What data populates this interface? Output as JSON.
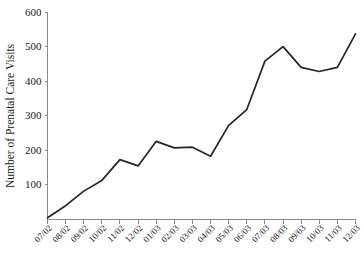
{
  "chart_data": {
    "type": "line",
    "title": "",
    "xlabel": "",
    "ylabel": "Number of Prenatal Care Visits",
    "categories": [
      "07/02",
      "08/02",
      "09/02",
      "10/02",
      "11/02",
      "12/02",
      "01/03",
      "02/03",
      "03/03",
      "04/03",
      "05/03",
      "06/03",
      "07/03",
      "08/03",
      "09/03",
      "10/03",
      "11/03",
      "12/03"
    ],
    "values": [
      5,
      40,
      82,
      113,
      173,
      155,
      226,
      207,
      209,
      183,
      272,
      318,
      458,
      500,
      440,
      428,
      440,
      537
    ],
    "series": [
      {
        "name": "Number of Prenatal Care Visits",
        "values": [
          5,
          40,
          82,
          113,
          173,
          155,
          226,
          207,
          209,
          183,
          272,
          318,
          458,
          500,
          440,
          428,
          440,
          537
        ]
      }
    ],
    "ylim": [
      0,
      600
    ],
    "ytick_labels": [
      "100",
      "200",
      "300",
      "400",
      "500",
      "600"
    ],
    "ytick_values": [
      100,
      200,
      300,
      400,
      500,
      600
    ],
    "xtick_labels": [
      "07/02",
      "08/02",
      "09/02",
      "10/02",
      "11/02",
      "12/02",
      "01/03",
      "02/03",
      "03/03",
      "04/03",
      "05/03",
      "06/03",
      "07/03",
      "08/03",
      "09/03",
      "10/03",
      "11/03",
      "12/03"
    ],
    "grid": false,
    "legend": false,
    "legend_position": "none",
    "line_color": "#262626",
    "axis_color": "#8a8a8a"
  }
}
